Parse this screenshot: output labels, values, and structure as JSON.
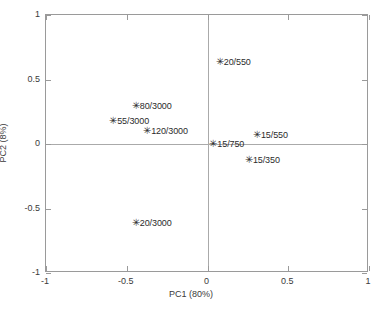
{
  "chart_data": {
    "type": "scatter",
    "title": "",
    "xlabel": "PC1 (80%)",
    "ylabel": "PC2 (8%)",
    "xlim": [
      -1,
      1
    ],
    "ylim": [
      -1,
      1
    ],
    "xticks": [
      "-1",
      "-0.5",
      "0",
      "0.5",
      "1"
    ],
    "xtick_values": [
      -1,
      -0.5,
      0,
      0.5,
      1
    ],
    "yticks": [
      "1",
      "0.5",
      "0",
      "-0.5",
      "-1"
    ],
    "ytick_values": [
      1,
      0.5,
      0,
      -0.5,
      -1
    ],
    "grid": false,
    "legend": "none",
    "marker": "asterisk",
    "marker_glyph": "✳",
    "zero_lines": true,
    "frame_color": "#9a9a9a",
    "zero_line_color": "#aaaaaa",
    "marker_color": "#2b2b2b",
    "background": "#ffffff",
    "points": [
      {
        "label": "20/550",
        "x": 0.07,
        "y": 0.64
      },
      {
        "label": "80/3000",
        "x": -0.45,
        "y": 0.3
      },
      {
        "label": "55/3000",
        "x": -0.59,
        "y": 0.18
      },
      {
        "label": "120/3000",
        "x": -0.38,
        "y": 0.1
      },
      {
        "label": "15/550",
        "x": 0.3,
        "y": 0.07
      },
      {
        "label": "15/750",
        "x": 0.03,
        "y": 0.0
      },
      {
        "label": "15/350",
        "x": 0.25,
        "y": -0.12
      },
      {
        "label": "20/3000",
        "x": -0.45,
        "y": -0.61
      }
    ]
  }
}
